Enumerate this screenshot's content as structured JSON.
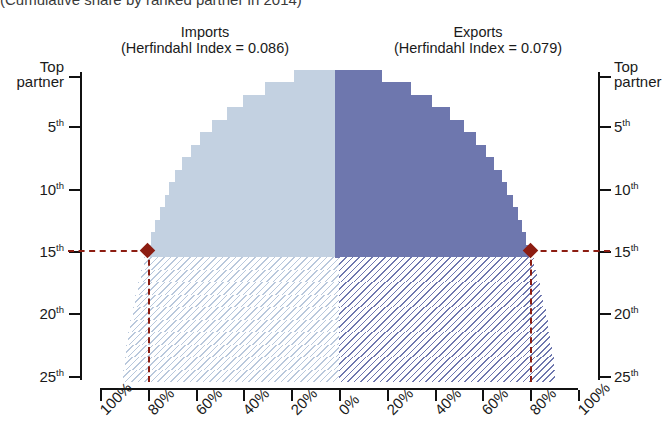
{
  "title": "(Cumulative share by ranked partner in 2014)",
  "panels": {
    "imports": {
      "name": "Imports",
      "hi_label": "(Herfindahl Index = 0.086)",
      "hi_value": 0.086,
      "color": "#c3d1e1"
    },
    "exports": {
      "name": "Exports",
      "hi_label": "(Herfindahl Index = 0.079)",
      "hi_value": 0.079,
      "color": "#6e77ae"
    }
  },
  "axes": {
    "y_left_label_top": "Top",
    "y_left_label_bottom": "partner",
    "y_ticks": [
      "5",
      "10",
      "15",
      "20",
      "25"
    ],
    "y_tick_suffix": "th",
    "x_left_ticks": [
      "100%",
      "80%",
      "60%",
      "40%",
      "20%",
      "0%"
    ],
    "x_right_ticks": [
      "20%",
      "40%",
      "60%",
      "80%",
      "100%"
    ]
  },
  "highlight": {
    "color": "#8c1d12",
    "partner_rank": 15,
    "imports_share": "80%",
    "exports_share": "80%"
  },
  "chart_data": {
    "type": "area",
    "title": "(Cumulative share by ranked partner in 2014)",
    "xlabel": "Cumulative share (%)",
    "ylabel": "Partner rank",
    "grid": false,
    "legend": "none",
    "orientation": "mirrored-horizontal",
    "xlim": [
      0,
      100
    ],
    "ylim": [
      1,
      25
    ],
    "y_categories": [
      "Top partner",
      "2nd",
      "3rd",
      "4th",
      "5th",
      "6th",
      "7th",
      "8th",
      "9th",
      "10th",
      "11th",
      "12th",
      "13th",
      "14th",
      "15th",
      "16th",
      "17th",
      "18th",
      "19th",
      "20th",
      "21st",
      "22nd",
      "23rd",
      "24th",
      "25th"
    ],
    "series": [
      {
        "name": "Imports",
        "direction": "left",
        "color": "#c3d1e1",
        "herfindahl_index": 0.086,
        "cumulative_share_pct": [
          19.0,
          31.0,
          40.0,
          47.0,
          53.0,
          58.0,
          62.0,
          65.5,
          68.5,
          71.0,
          73.0,
          75.0,
          76.8,
          78.5,
          80.0,
          81.4,
          82.7,
          84.0,
          85.2,
          86.3,
          87.3,
          88.2,
          89.0,
          89.7,
          90.3
        ]
      },
      {
        "name": "Exports",
        "direction": "right",
        "color": "#6e77ae",
        "herfindahl_index": 0.079,
        "cumulative_share_pct": [
          18.0,
          30.0,
          39.0,
          46.5,
          52.5,
          57.5,
          61.5,
          65.0,
          68.0,
          70.5,
          72.8,
          74.8,
          76.6,
          78.3,
          80.0,
          81.5,
          82.9,
          84.2,
          85.4,
          86.5,
          87.5,
          88.4,
          89.2,
          89.9,
          90.5
        ]
      }
    ],
    "annotations": [
      {
        "type": "crosshair",
        "rank": 15,
        "value_pct": 80,
        "series": "Imports",
        "color": "#8c1d12",
        "marker": "diamond"
      },
      {
        "type": "crosshair",
        "rank": 15,
        "value_pct": 80,
        "series": "Exports",
        "color": "#8c1d12",
        "marker": "diamond"
      }
    ],
    "region_styles": {
      "above_rank_15": "solid",
      "below_rank_15": "diagonal-hatch"
    }
  }
}
